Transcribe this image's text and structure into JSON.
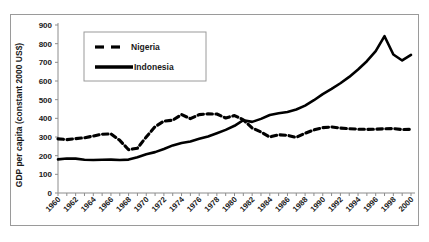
{
  "chart_data": {
    "type": "line",
    "title": "",
    "subtitle": "",
    "xlabel": "",
    "ylabel": "GDP per capita (constant 2000 US$)",
    "xlim": [
      1960,
      2000
    ],
    "ylim": [
      0,
      900
    ],
    "ytick_step": 100,
    "yticks": [
      "0",
      "100",
      "200",
      "300",
      "400",
      "500",
      "600",
      "700",
      "800",
      "900"
    ],
    "xticks": [
      "1960",
      "1962",
      "1964",
      "1966",
      "1968",
      "1970",
      "1972",
      "1974",
      "1976",
      "1978",
      "1980",
      "1982",
      "1984",
      "1986",
      "1988",
      "1990",
      "1992",
      "1994",
      "1996",
      "1998",
      "2000"
    ],
    "xtick_step": 2,
    "x": [
      1960,
      1961,
      1962,
      1963,
      1964,
      1965,
      1966,
      1967,
      1968,
      1969,
      1970,
      1971,
      1972,
      1973,
      1974,
      1975,
      1976,
      1977,
      1978,
      1979,
      1980,
      1981,
      1982,
      1983,
      1984,
      1985,
      1986,
      1987,
      1988,
      1989,
      1990,
      1991,
      1992,
      1993,
      1994,
      1995,
      1996,
      1997,
      1998,
      1999,
      2000
    ],
    "grid": false,
    "legend_position": "upper-left-inside",
    "series": [
      {
        "name": "Nigeria",
        "style": "dashed",
        "color": "#000000",
        "values": [
          290,
          286,
          291,
          296,
          305,
          315,
          317,
          282,
          232,
          240,
          300,
          355,
          385,
          390,
          420,
          398,
          420,
          424,
          423,
          402,
          415,
          392,
          348,
          327,
          300,
          312,
          309,
          298,
          320,
          338,
          350,
          354,
          348,
          344,
          342,
          341,
          342,
          344,
          345,
          340,
          341
        ]
      },
      {
        "name": "Indonesia",
        "style": "solid",
        "color": "#000000",
        "values": [
          180,
          185,
          184,
          178,
          177,
          178,
          179,
          177,
          179,
          192,
          208,
          219,
          236,
          255,
          268,
          276,
          290,
          303,
          320,
          338,
          360,
          390,
          381,
          397,
          418,
          427,
          434,
          447,
          468,
          497,
          530,
          558,
          588,
          622,
          662,
          706,
          760,
          840,
          742,
          710,
          740
        ]
      }
    ]
  },
  "legend": {
    "entries": [
      {
        "label": "Nigeria",
        "style": "dashed"
      },
      {
        "label": "Indonesia",
        "style": "solid"
      }
    ]
  }
}
